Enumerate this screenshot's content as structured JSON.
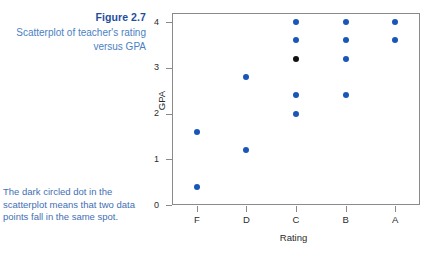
{
  "figure": {
    "title": "Figure 2.7",
    "caption": "Scatterplot of teacher's rating versus GPA",
    "note": "The dark circled dot in the scatterplot means that two data points fall in the same spot.",
    "title_color": "#1f4e9c",
    "caption_color": "#4b7fc4",
    "note_color": "#3f6fb5"
  },
  "chart_data": {
    "type": "scatter",
    "title": "",
    "xlabel": "Rating",
    "ylabel": "GPA",
    "categories": [
      "F",
      "D",
      "C",
      "B",
      "A"
    ],
    "xtick_labels": [
      "F",
      "D",
      "C",
      "B",
      "A"
    ],
    "ytick_labels": [
      "0",
      "1",
      "2",
      "3",
      "4"
    ],
    "yticks": [
      0,
      1,
      2,
      3,
      4
    ],
    "ylim": [
      0,
      4.2
    ],
    "grid": false,
    "legend": null,
    "marker_color": "#1a56b8",
    "overlap_marker_color": "#111111",
    "points": [
      {
        "x": "F",
        "y": 1.6,
        "overlap": false
      },
      {
        "x": "F",
        "y": 0.4,
        "overlap": false
      },
      {
        "x": "D",
        "y": 2.8,
        "overlap": false
      },
      {
        "x": "D",
        "y": 1.2,
        "overlap": false
      },
      {
        "x": "C",
        "y": 4.0,
        "overlap": false
      },
      {
        "x": "C",
        "y": 3.6,
        "overlap": false
      },
      {
        "x": "C",
        "y": 3.2,
        "overlap": true
      },
      {
        "x": "C",
        "y": 2.4,
        "overlap": false
      },
      {
        "x": "C",
        "y": 2.0,
        "overlap": false
      },
      {
        "x": "B",
        "y": 4.0,
        "overlap": false
      },
      {
        "x": "B",
        "y": 3.6,
        "overlap": false
      },
      {
        "x": "B",
        "y": 3.2,
        "overlap": false
      },
      {
        "x": "B",
        "y": 2.4,
        "overlap": false
      },
      {
        "x": "A",
        "y": 4.0,
        "overlap": false
      },
      {
        "x": "A",
        "y": 3.6,
        "overlap": false
      }
    ]
  }
}
